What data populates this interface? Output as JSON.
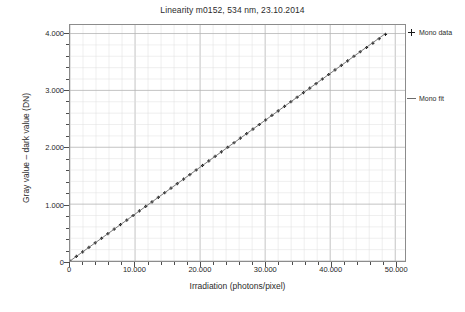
{
  "chart_data": {
    "type": "scatter",
    "title": "Linearity m0152, 534 nm, 23.10.2014",
    "xlabel": "Irradiation (photons/pixel)",
    "ylabel": "Gray value – dark value (DN)",
    "xlim": [
      0,
      51500
    ],
    "ylim": [
      0,
      4150
    ],
    "grid": true,
    "grid_major_x": 10000,
    "grid_minor_x": 2000,
    "grid_major_y": 1000,
    "grid_minor_y": 200,
    "legend_position": "right",
    "xticks": [
      0,
      10000,
      20000,
      30000,
      40000,
      50000
    ],
    "xtick_labels": [
      "0",
      "10.000",
      "20.000",
      "30.000",
      "40.000",
      "50.000"
    ],
    "yticks": [
      0,
      1000,
      2000,
      3000,
      4000
    ],
    "ytick_labels": [
      "0",
      "1.000",
      "2.000",
      "3.000",
      "4.000"
    ],
    "series": [
      {
        "name": "Mono data",
        "marker": "plus",
        "color": "#1a1a1a",
        "x": [
          0,
          970,
          1940,
          2910,
          3880,
          4850,
          5820,
          6790,
          7760,
          8730,
          9700,
          10670,
          11640,
          12610,
          13580,
          14550,
          15520,
          16490,
          17460,
          18430,
          19400,
          20370,
          21340,
          22310,
          23280,
          24250,
          25220,
          26190,
          27160,
          28130,
          29100,
          30070,
          31040,
          32010,
          32980,
          33950,
          34920,
          35890,
          36860,
          37830,
          38800,
          39770,
          40740,
          41710,
          42680,
          43650,
          44620,
          45590,
          46560,
          47530,
          48500
        ],
        "y": [
          0,
          80,
          160,
          240,
          320,
          400,
          480,
          560,
          640,
          720,
          800,
          880,
          960,
          1040,
          1120,
          1200,
          1280,
          1360,
          1440,
          1520,
          1600,
          1680,
          1760,
          1840,
          1920,
          2000,
          2080,
          2160,
          2240,
          2320,
          2400,
          2480,
          2560,
          2640,
          2720,
          2800,
          2880,
          2960,
          3040,
          3120,
          3200,
          3280,
          3360,
          3440,
          3520,
          3600,
          3680,
          3755,
          3830,
          3910,
          3985
        ]
      },
      {
        "name": "Mono fit",
        "marker": "line",
        "color": "#6b6b6b",
        "x": [
          0,
          48500
        ],
        "y": [
          0,
          4000
        ],
        "slope": 0.0825,
        "intercept": 0
      }
    ]
  },
  "legend": {
    "items": [
      {
        "label": "Mono data",
        "marker": "plus"
      },
      {
        "label": "Mono fit",
        "marker": "line"
      }
    ]
  },
  "caption": {
    "text": ""
  }
}
